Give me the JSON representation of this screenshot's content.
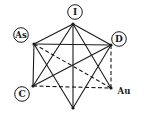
{
  "diagram": {
    "nodes": [
      {
        "id": "I",
        "label": "I",
        "x": 73,
        "y": 24,
        "label_x": 75,
        "label_y": 12,
        "circled": true
      },
      {
        "id": "As",
        "label": "As",
        "x": 34,
        "y": 44,
        "label_x": 21,
        "label_y": 35,
        "circled": true
      },
      {
        "id": "D",
        "label": "D",
        "x": 111,
        "y": 45,
        "label_x": 119,
        "label_y": 39,
        "circled": true
      },
      {
        "id": "C",
        "label": "C",
        "x": 33,
        "y": 86,
        "label_x": 22,
        "label_y": 94,
        "circled": true
      },
      {
        "id": "Au",
        "label": "Au",
        "x": 111,
        "y": 88,
        "label_x": 124,
        "label_y": 91,
        "circled": false
      },
      {
        "id": "B",
        "label": "",
        "x": 73,
        "y": 108,
        "circled": false
      }
    ],
    "edges": [
      {
        "from": "I",
        "to": "As",
        "style": "solid"
      },
      {
        "from": "I",
        "to": "D",
        "style": "solid"
      },
      {
        "from": "I",
        "to": "C",
        "style": "solid"
      },
      {
        "from": "I",
        "to": "Au",
        "style": "solid"
      },
      {
        "from": "I",
        "to": "B",
        "style": "solid"
      },
      {
        "from": "As",
        "to": "D",
        "style": "solid"
      },
      {
        "from": "As",
        "to": "C",
        "style": "solid"
      },
      {
        "from": "As",
        "to": "Au",
        "style": "dashed"
      },
      {
        "from": "As",
        "to": "B",
        "style": "solid"
      },
      {
        "from": "D",
        "to": "C",
        "style": "solid"
      },
      {
        "from": "D",
        "to": "Au",
        "style": "dashed"
      },
      {
        "from": "D",
        "to": "B",
        "style": "solid"
      },
      {
        "from": "C",
        "to": "Au",
        "style": "dashed"
      }
    ],
    "colors": {
      "line": "#1a1a1a",
      "background": "#ffffff"
    }
  }
}
